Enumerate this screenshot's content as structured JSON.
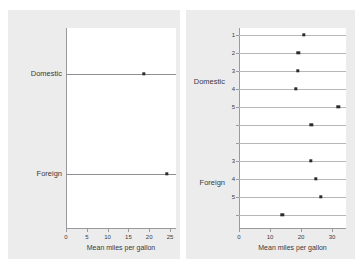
{
  "figure": {
    "background_color": "#ffffff",
    "panel_background_color": "#ececed",
    "plot_background_color": "#ffffff",
    "marker_color": "#2b2b2d",
    "line_color": "#b7b7bb",
    "axis_color": "#9a9a9e"
  },
  "chart_data": [
    {
      "type": "scatter",
      "panel": "left",
      "title": "",
      "xlabel": "Mean miles per gallon",
      "ylabel": "",
      "xlim": [
        0,
        26
      ],
      "xticks": [
        0,
        5,
        10,
        15,
        20,
        25
      ],
      "xticklabels": [
        "0",
        "5",
        "10",
        "15",
        "20",
        "25"
      ],
      "grid": false,
      "orientation": "horizontal",
      "categories": [
        "Domestic",
        "Foreign"
      ],
      "values": [
        18.7,
        24.3
      ],
      "points": [
        {
          "label": "Domestic",
          "value": 18.7
        },
        {
          "label": "Foreign",
          "value": 24.3
        }
      ]
    },
    {
      "type": "scatter",
      "panel": "right",
      "title": "",
      "xlabel": "Mean miles per gallon",
      "ylabel": "",
      "xlim": [
        0,
        34
      ],
      "xticks": [
        0,
        10,
        20,
        30
      ],
      "xticklabels": [
        "0",
        "10",
        "20",
        "30"
      ],
      "grid": false,
      "orientation": "horizontal",
      "group_labels": [
        "Domestic",
        "Foreign"
      ],
      "categories": [
        "1",
        "2",
        "3",
        "4",
        "5",
        "",
        "",
        "3",
        "4",
        "5",
        ""
      ],
      "values": [
        21.0,
        19.1,
        19.0,
        18.4,
        32.0,
        23.3,
        null,
        23.2,
        24.7,
        26.3,
        14.0
      ],
      "points": [
        {
          "group": "Domestic",
          "label": "1",
          "value": 21.0
        },
        {
          "group": "Domestic",
          "label": "2",
          "value": 19.1
        },
        {
          "group": "Domestic",
          "label": "3",
          "value": 19.0
        },
        {
          "group": "Domestic",
          "label": "4",
          "value": 18.4
        },
        {
          "group": "Domestic",
          "label": "5",
          "value": 32.0
        },
        {
          "group": "Domestic",
          "label": "",
          "value": 23.3
        },
        {
          "group": "Foreign",
          "label": "",
          "value": null
        },
        {
          "group": "Foreign",
          "label": "3",
          "value": 23.2
        },
        {
          "group": "Foreign",
          "label": "4",
          "value": 24.7
        },
        {
          "group": "Foreign",
          "label": "5",
          "value": 26.3
        },
        {
          "group": "Foreign",
          "label": "",
          "value": 14.0
        }
      ]
    }
  ]
}
